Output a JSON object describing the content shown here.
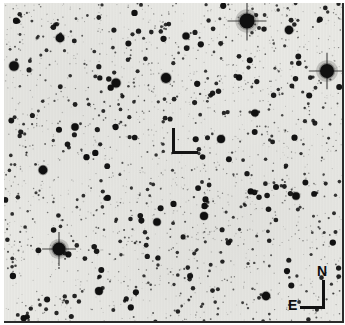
{
  "image": {
    "kind": "astronomical-finder-chart",
    "presentation": "negative",
    "width": 345,
    "height": 325,
    "background_color": "#e9e9e5",
    "star_color": "#101010",
    "border_color": "#ffffff",
    "plate_edge_color": "#2b2b2b"
  },
  "target_marker": {
    "shape": "L-bracket",
    "color": "#141414",
    "x": 172,
    "y": 128,
    "width": 26,
    "height": 28,
    "stroke": 3
  },
  "compass": {
    "north_label": "N",
    "east_label": "E",
    "color": "#0d0d0d",
    "x": 288,
    "y": 264,
    "vertical_axis_length": 29,
    "horizontal_axis_length": 25
  },
  "starfield": {
    "seed": 20240517,
    "count": 900,
    "radius_min": 0.7,
    "radius_max": 3.2,
    "bright_stars": [
      {
        "cx": 247,
        "cy": 21,
        "r": 7.5,
        "spikes": true
      },
      {
        "cx": 327,
        "cy": 71,
        "r": 7.0,
        "spikes": true
      },
      {
        "cx": 59,
        "cy": 249,
        "r": 6.5,
        "spikes": true
      },
      {
        "cx": 166,
        "cy": 78,
        "r": 5.0,
        "spikes": false
      },
      {
        "cx": 116,
        "cy": 83,
        "r": 4.6,
        "spikes": false
      },
      {
        "cx": 43,
        "cy": 170,
        "r": 4.4,
        "spikes": false
      },
      {
        "cx": 14,
        "cy": 66,
        "r": 4.8,
        "spikes": false
      },
      {
        "cx": 60,
        "cy": 38,
        "r": 4.3,
        "spikes": false
      },
      {
        "cx": 289,
        "cy": 30,
        "r": 4.2,
        "spikes": false
      },
      {
        "cx": 221,
        "cy": 139,
        "r": 4.0,
        "spikes": false
      },
      {
        "cx": 204,
        "cy": 216,
        "r": 4.0,
        "spikes": false
      },
      {
        "cx": 266,
        "cy": 296,
        "r": 4.2,
        "spikes": false
      },
      {
        "cx": 99,
        "cy": 291,
        "r": 3.9,
        "spikes": false
      },
      {
        "cx": 157,
        "cy": 222,
        "r": 3.8,
        "spikes": false
      },
      {
        "cx": 296,
        "cy": 196,
        "r": 3.8,
        "spikes": false
      },
      {
        "cx": 75,
        "cy": 127,
        "r": 3.7,
        "spikes": false
      },
      {
        "cx": 255,
        "cy": 113,
        "r": 3.6,
        "spikes": false
      },
      {
        "cx": 186,
        "cy": 36,
        "r": 3.6,
        "spikes": false
      }
    ]
  }
}
